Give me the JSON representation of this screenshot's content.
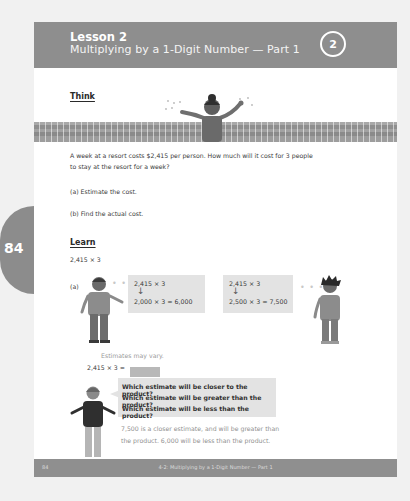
{
  "header": {
    "lesson": "Lesson 2",
    "subtitle": "Multiplying by a 1-Digit Number — Part 1",
    "lesson_number": "2"
  },
  "side_tab": {
    "page_number": "84"
  },
  "think": {
    "title": "Think",
    "problem_line1": "A week at a resort costs $2,415 per person. How much will it cost for 3 people",
    "problem_line2": "to stay at the resort for a week?",
    "part_a": "(a)   Estimate the cost.",
    "part_b": "(b)   Find the actual cost."
  },
  "learn": {
    "title": "Learn",
    "expression": "2,415 × 3",
    "part_a_label": "(a)",
    "estimate_left": {
      "line1": "2,415 × 3",
      "arrow": "↓",
      "line2": "2,000 × 3 = 6,000"
    },
    "estimate_right": {
      "line1": "2,415 × 3",
      "arrow": "↓",
      "line2": "2,500 × 3 = 7,500"
    },
    "estimates_note": "Estimates may vary.",
    "approx_expression": "2,415 × 3 ≈",
    "questions": [
      "Which estimate will be closer to the product?",
      "Which estimate will be greater than the product?",
      "Which estimate will be less than the product?"
    ],
    "answer_line1": "7,500 is a closer estimate, and will be greater than",
    "answer_line2": "the product. 6,000 will be less than the product."
  },
  "footer": {
    "page_number": "84",
    "chapter_title": "4-2: Multiplying by a 1-Digit Number — Part 1"
  }
}
